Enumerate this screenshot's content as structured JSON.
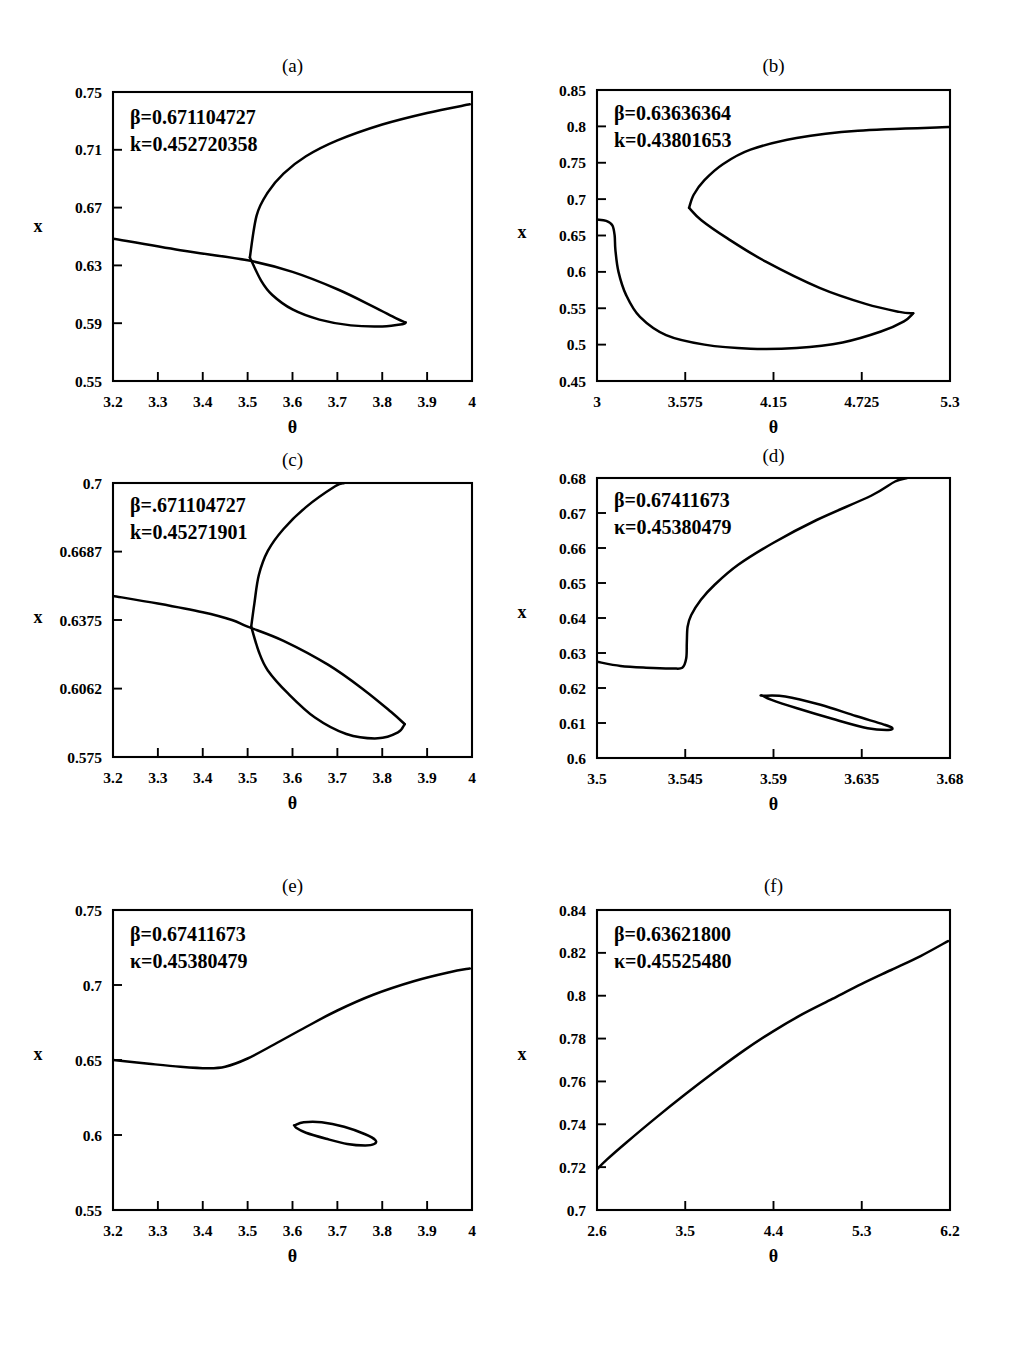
{
  "figure": {
    "type": "multi-panel-figure",
    "panel_count": 6,
    "shared_xlabel": "θ",
    "shared_ylabel": "x",
    "line_color": "#000000",
    "background_color": "#ffffff"
  },
  "chart_data": [
    {
      "id": "a",
      "type": "line",
      "title": "(a)",
      "xlabel": "θ",
      "ylabel": "x",
      "xlim": [
        3.2,
        4
      ],
      "ylim": [
        0.55,
        0.75
      ],
      "xticks": [
        "3.2",
        "3.3",
        "3.4",
        "3.5",
        "3.6",
        "3.7",
        "3.8",
        "3.9",
        "4"
      ],
      "xtick_values": [
        3.2,
        3.3,
        3.4,
        3.5,
        3.6,
        3.7,
        3.8,
        3.9,
        4
      ],
      "yticks": [
        "0.55",
        "0.59",
        "0.63",
        "0.67",
        "0.71",
        "0.75"
      ],
      "ytick_values": [
        0.55,
        0.59,
        0.63,
        0.67,
        0.71,
        0.75
      ],
      "grid": false,
      "annotations": [
        "β=0.671104727",
        "k=0.452720358"
      ],
      "parameters": {
        "beta": "0.671104727",
        "k": "0.452720358"
      },
      "series": [
        {
          "name": "upper-branch",
          "points": [
            [
              3.505,
              0.6355
            ],
            [
              3.52,
              0.6645
            ],
            [
              3.545,
              0.6805
            ],
            [
              3.58,
              0.6935
            ],
            [
              3.63,
              0.7055
            ],
            [
              3.7,
              0.7165
            ],
            [
              3.8,
              0.7275
            ],
            [
              3.9,
              0.7355
            ],
            [
              3.995,
              0.7415
            ]
          ]
        },
        {
          "name": "descending-branch",
          "points": [
            [
              3.2,
              0.6485
            ],
            [
              3.35,
              0.6405
            ],
            [
              3.5,
              0.6335
            ],
            [
              3.6,
              0.6255
            ],
            [
              3.7,
              0.6135
            ],
            [
              3.78,
              0.6015
            ],
            [
              3.83,
              0.5935
            ],
            [
              3.852,
              0.5905
            ]
          ]
        },
        {
          "name": "loop-lower",
          "points": [
            [
              3.505,
              0.6355
            ],
            [
              3.53,
              0.6195
            ],
            [
              3.555,
              0.6095
            ],
            [
              3.6,
              0.5995
            ],
            [
              3.66,
              0.5925
            ],
            [
              3.73,
              0.5885
            ],
            [
              3.8,
              0.5878
            ],
            [
              3.845,
              0.5893
            ],
            [
              3.852,
              0.5905
            ]
          ]
        }
      ]
    },
    {
      "id": "b",
      "type": "line",
      "title": "(b)",
      "xlabel": "θ",
      "ylabel": "x",
      "xlim": [
        3,
        5.3
      ],
      "ylim": [
        0.45,
        0.85
      ],
      "xticks": [
        "3",
        "3.575",
        "4.15",
        "4.725",
        "5.3"
      ],
      "xtick_values": [
        3,
        3.575,
        4.15,
        4.725,
        5.3
      ],
      "yticks": [
        "0.45",
        "0.5",
        "0.55",
        "0.6",
        "0.65",
        "0.7",
        "0.75",
        "0.8",
        "0.85"
      ],
      "ytick_values": [
        0.45,
        0.5,
        0.55,
        0.6,
        0.65,
        0.7,
        0.75,
        0.8,
        0.85
      ],
      "grid": false,
      "annotations": [
        "β=0.63636364",
        "k=0.43801653"
      ],
      "parameters": {
        "beta": "0.63636364",
        "k": "0.43801653"
      },
      "series": [
        {
          "name": "upper-branch",
          "points": [
            [
              3.6,
              0.688
            ],
            [
              3.63,
              0.706
            ],
            [
              3.7,
              0.726
            ],
            [
              3.82,
              0.748
            ],
            [
              4.0,
              0.768
            ],
            [
              4.3,
              0.784
            ],
            [
              4.7,
              0.794
            ],
            [
              5.29,
              0.799
            ]
          ]
        },
        {
          "name": "middle-branch",
          "points": [
            [
              3.6,
              0.688
            ],
            [
              3.68,
              0.671
            ],
            [
              3.85,
              0.646
            ],
            [
              4.1,
              0.614
            ],
            [
              4.45,
              0.578
            ],
            [
              4.75,
              0.556
            ],
            [
              4.97,
              0.545
            ],
            [
              5.06,
              0.543
            ]
          ]
        },
        {
          "name": "lower-branch",
          "points": [
            [
              3.0,
              0.672
            ],
            [
              3.06,
              0.67
            ],
            [
              3.1,
              0.664
            ],
            [
              3.115,
              0.65
            ],
            [
              3.12,
              0.63
            ],
            [
              3.14,
              0.6
            ],
            [
              3.19,
              0.568
            ],
            [
              3.28,
              0.538
            ],
            [
              3.45,
              0.513
            ],
            [
              3.7,
              0.5
            ],
            [
              4.0,
              0.4945
            ],
            [
              4.3,
              0.4955
            ],
            [
              4.6,
              0.503
            ],
            [
              4.85,
              0.518
            ],
            [
              5.0,
              0.532
            ],
            [
              5.06,
              0.543
            ]
          ]
        }
      ]
    },
    {
      "id": "c",
      "type": "line",
      "title": "(c)",
      "xlabel": "θ",
      "ylabel": "x",
      "xlim": [
        3.2,
        4
      ],
      "ylim": [
        0.575,
        0.7
      ],
      "xticks": [
        "3.2",
        "3.3",
        "3.4",
        "3.5",
        "3.6",
        "3.7",
        "3.8",
        "3.9",
        "4"
      ],
      "xtick_values": [
        3.2,
        3.3,
        3.4,
        3.5,
        3.6,
        3.7,
        3.8,
        3.9,
        4
      ],
      "yticks": [
        "0.575",
        "0.6062",
        "0.6375",
        "0.6687",
        "0.7"
      ],
      "ytick_values": [
        0.575,
        0.6062,
        0.6375,
        0.6687,
        0.7
      ],
      "grid": false,
      "annotations": [
        "β=.671104727",
        "k=0.45271901"
      ],
      "parameters": {
        "beta": ".671104727",
        "k": "0.45271901"
      },
      "series": [
        {
          "name": "upper-branch",
          "points": [
            [
              3.508,
              0.6345
            ],
            [
              3.515,
              0.645
            ],
            [
              3.525,
              0.658
            ],
            [
              3.545,
              0.669
            ],
            [
              3.58,
              0.679
            ],
            [
              3.63,
              0.689
            ],
            [
              3.695,
              0.6985
            ],
            [
              3.715,
              0.7
            ]
          ]
        },
        {
          "name": "descending-branch",
          "points": [
            [
              3.2,
              0.6485
            ],
            [
              3.3,
              0.645
            ],
            [
              3.4,
              0.641
            ],
            [
              3.465,
              0.6375
            ],
            [
              3.5,
              0.6345
            ],
            [
              3.58,
              0.628
            ],
            [
              3.68,
              0.617
            ],
            [
              3.76,
              0.6055
            ],
            [
              3.82,
              0.5955
            ],
            [
              3.85,
              0.59
            ]
          ]
        },
        {
          "name": "loop-lower",
          "points": [
            [
              3.508,
              0.6345
            ],
            [
              3.525,
              0.623
            ],
            [
              3.545,
              0.6145
            ],
            [
              3.59,
              0.604
            ],
            [
              3.65,
              0.593
            ],
            [
              3.72,
              0.5855
            ],
            [
              3.79,
              0.5835
            ],
            [
              3.835,
              0.5862
            ],
            [
              3.85,
              0.59
            ]
          ]
        }
      ]
    },
    {
      "id": "d",
      "type": "line",
      "title": "(d)",
      "xlabel": "θ",
      "ylabel": "x",
      "xlim": [
        3.5,
        3.68
      ],
      "ylim": [
        0.6,
        0.68
      ],
      "xticks": [
        "3.5",
        "3.545",
        "3.59",
        "3.635",
        "3.68"
      ],
      "xtick_values": [
        3.5,
        3.545,
        3.59,
        3.635,
        3.68
      ],
      "yticks": [
        "0.6",
        "0.61",
        "0.62",
        "0.63",
        "0.64",
        "0.65",
        "0.66",
        "0.67",
        "0.68"
      ],
      "ytick_values": [
        0.6,
        0.61,
        0.62,
        0.63,
        0.64,
        0.65,
        0.66,
        0.67,
        0.68
      ],
      "grid": false,
      "annotations": [
        "β=0.67411673",
        "κ=0.45380479"
      ],
      "parameters": {
        "beta": "0.67411673",
        "kappa": "0.45380479"
      },
      "series": [
        {
          "name": "main-branch",
          "points": [
            [
              3.5,
              0.6275
            ],
            [
              3.512,
              0.6263
            ],
            [
              3.525,
              0.6258
            ],
            [
              3.538,
              0.6256
            ],
            [
              3.5435,
              0.6258
            ],
            [
              3.5455,
              0.6285
            ],
            [
              3.5458,
              0.633
            ],
            [
              3.5462,
              0.6375
            ],
            [
              3.548,
              0.6408
            ],
            [
              3.553,
              0.6452
            ],
            [
              3.56,
              0.6495
            ],
            [
              3.572,
              0.6552
            ],
            [
              3.59,
              0.6615
            ],
            [
              3.612,
              0.668
            ],
            [
              3.64,
              0.675
            ],
            [
              3.652,
              0.679
            ],
            [
              3.658,
              0.68
            ]
          ]
        },
        {
          "name": "isola-ellipse",
          "closed": true,
          "points": [
            [
              3.5845,
              0.6178
            ],
            [
              3.596,
              0.6176
            ],
            [
              3.614,
              0.6152
            ],
            [
              3.632,
              0.612
            ],
            [
              3.646,
              0.6096
            ],
            [
              3.6505,
              0.6086
            ],
            [
              3.6485,
              0.608
            ],
            [
              3.638,
              0.6085
            ],
            [
              3.62,
              0.6112
            ],
            [
              3.602,
              0.6142
            ],
            [
              3.589,
              0.6166
            ],
            [
              3.5845,
              0.6178
            ]
          ]
        }
      ]
    },
    {
      "id": "e",
      "type": "line",
      "title": "(e)",
      "xlabel": "θ",
      "ylabel": "x",
      "xlim": [
        3.2,
        4
      ],
      "ylim": [
        0.55,
        0.75
      ],
      "xticks": [
        "3.2",
        "3.3",
        "3.4",
        "3.5",
        "3.6",
        "3.7",
        "3.8",
        "3.9",
        "4"
      ],
      "xtick_values": [
        3.2,
        3.3,
        3.4,
        3.5,
        3.6,
        3.7,
        3.8,
        3.9,
        4
      ],
      "yticks": [
        "0.55",
        "0.6",
        "0.65",
        "0.7",
        "0.75"
      ],
      "ytick_values": [
        0.55,
        0.6,
        0.65,
        0.7,
        0.75
      ],
      "grid": false,
      "annotations": [
        "β=0.67411673",
        "κ=0.45380479"
      ],
      "parameters": {
        "beta": "0.67411673",
        "kappa": "0.45380479"
      },
      "series": [
        {
          "name": "main-branch",
          "points": [
            [
              3.2,
              0.65
            ],
            [
              3.28,
              0.6475
            ],
            [
              3.35,
              0.6455
            ],
            [
              3.41,
              0.6445
            ],
            [
              3.45,
              0.6455
            ],
            [
              3.5,
              0.651
            ],
            [
              3.56,
              0.6605
            ],
            [
              3.63,
              0.672
            ],
            [
              3.7,
              0.683
            ],
            [
              3.78,
              0.6935
            ],
            [
              3.87,
              0.7025
            ],
            [
              3.95,
              0.7085
            ],
            [
              3.995,
              0.711
            ]
          ]
        },
        {
          "name": "isola-ellipse",
          "closed": true,
          "points": [
            [
              3.605,
              0.6065
            ],
            [
              3.625,
              0.6085
            ],
            [
              3.665,
              0.6085
            ],
            [
              3.715,
              0.6055
            ],
            [
              3.762,
              0.6005
            ],
            [
              3.785,
              0.5965
            ],
            [
              3.782,
              0.594
            ],
            [
              3.762,
              0.593
            ],
            [
              3.722,
              0.594
            ],
            [
              3.675,
              0.5975
            ],
            [
              3.63,
              0.6015
            ],
            [
              3.608,
              0.6048
            ],
            [
              3.605,
              0.6065
            ]
          ]
        }
      ]
    },
    {
      "id": "f",
      "type": "line",
      "title": "(f)",
      "xlabel": "θ",
      "ylabel": "x",
      "xlim": [
        2.6,
        6.2
      ],
      "ylim": [
        0.7,
        0.84
      ],
      "xticks": [
        "2.6",
        "3.5",
        "4.4",
        "5.3",
        "6.2"
      ],
      "xtick_values": [
        2.6,
        3.5,
        4.4,
        5.3,
        6.2
      ],
      "yticks": [
        "0.7",
        "0.72",
        "0.74",
        "0.76",
        "0.78",
        "0.8",
        "0.82",
        "0.84"
      ],
      "ytick_values": [
        0.7,
        0.72,
        0.74,
        0.76,
        0.78,
        0.8,
        0.82,
        0.84
      ],
      "grid": false,
      "annotations": [
        "β=0.63621800",
        "κ=0.45525480"
      ],
      "parameters": {
        "beta": "0.63621800",
        "kappa": "0.45525480"
      },
      "series": [
        {
          "name": "main-branch",
          "points": [
            [
              2.6,
              0.719
            ],
            [
              2.7,
              0.7235
            ],
            [
              2.9,
              0.7315
            ],
            [
              3.2,
              0.743
            ],
            [
              3.5,
              0.754
            ],
            [
              3.8,
              0.7645
            ],
            [
              4.1,
              0.7745
            ],
            [
              4.4,
              0.7835
            ],
            [
              4.7,
              0.7915
            ],
            [
              5.0,
              0.7985
            ],
            [
              5.3,
              0.8055
            ],
            [
              5.6,
              0.812
            ],
            [
              5.9,
              0.8185
            ],
            [
              6.18,
              0.8255
            ]
          ]
        }
      ]
    }
  ]
}
